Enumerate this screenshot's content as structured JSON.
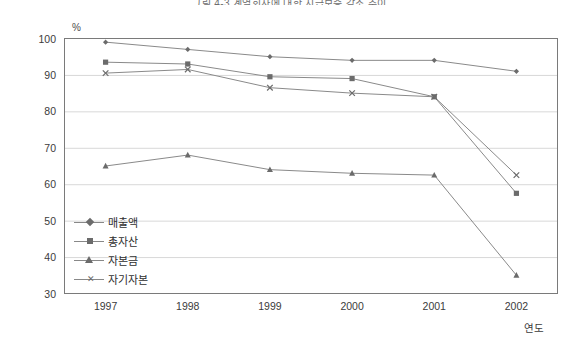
{
  "chart_data": {
    "type": "line",
    "title": "그림 4-3  계열회사에 대한 지급보증 감소 추이",
    "xlabel": "연도",
    "ylabel": "%",
    "x": [
      "1997",
      "1998",
      "1999",
      "2000",
      "2001",
      "2002"
    ],
    "categories": [
      "1997",
      "1998",
      "1999",
      "2000",
      "2001",
      "2002"
    ],
    "ylim": [
      30,
      100
    ],
    "yticks": [
      30,
      40,
      50,
      60,
      70,
      80,
      90,
      100
    ],
    "grid": true,
    "legend_position": "inside-lower-left",
    "series": [
      {
        "name": "매출액",
        "marker": "diamond",
        "values": [
          99,
          97,
          95,
          94,
          94,
          91
        ]
      },
      {
        "name": "총자산",
        "marker": "square",
        "values": [
          93.5,
          93,
          89.5,
          89,
          84,
          57.5
        ]
      },
      {
        "name": "자본금",
        "marker": "triangle",
        "values": [
          65,
          68,
          64,
          63,
          62.5,
          35
        ]
      },
      {
        "name": "자기자본",
        "marker": "cross",
        "values": [
          90.5,
          91.5,
          86.5,
          85,
          84,
          62.5
        ]
      }
    ],
    "colors": {
      "line": "#8a8a8a",
      "marker": "#6b6b6b",
      "grid": "#d8d8d8",
      "frame": "#7a7a7a",
      "text": "#3b3b3b"
    }
  },
  "axis": {
    "unit_label": "%",
    "x_axis_title": "연도",
    "y_tick_labels": [
      "100",
      "90",
      "80",
      "70",
      "60",
      "50",
      "40",
      "30"
    ],
    "x_tick_labels": [
      "1997",
      "1998",
      "1999",
      "2000",
      "2001",
      "2002"
    ]
  },
  "legend": {
    "items": [
      {
        "label": "매출액",
        "marker": "diamond"
      },
      {
        "label": "총자산",
        "marker": "square"
      },
      {
        "label": "자본금",
        "marker": "triangle"
      },
      {
        "label": "자기자본",
        "marker": "cross"
      }
    ]
  }
}
